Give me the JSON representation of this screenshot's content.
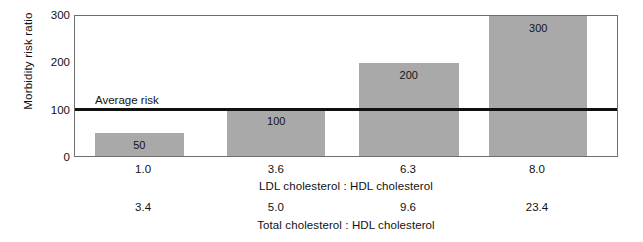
{
  "chart_data": {
    "type": "bar",
    "title": "",
    "subtitle": "",
    "ylabel": "Morbidity risk ratio",
    "ylim": [
      0,
      300
    ],
    "yticks": [
      0,
      100,
      200,
      300
    ],
    "ytick_labels": [
      "0",
      "100",
      "200",
      "300"
    ],
    "grid": false,
    "legend": null,
    "xlabel": "LDL cholesterol : HDL cholesterol",
    "xlabel_secondary": "Total cholesterol : HDL cholesterol",
    "categories": [
      "1.0",
      "3.6",
      "6.3",
      "8.0"
    ],
    "categories_secondary": [
      "3.4",
      "5.0",
      "9.6",
      "23.4"
    ],
    "values": [
      50,
      100,
      200,
      300
    ],
    "value_labels": [
      "50",
      "100",
      "200",
      "300"
    ],
    "bar_color": "#a9a9a9",
    "annotations": [
      {
        "name": "average-risk-line",
        "label": "Average risk",
        "y_value": 100,
        "color": "#111111"
      }
    ],
    "axis_color": "#6e6e6e"
  },
  "bars": [
    {
      "label": "1.0",
      "label2": "3.4",
      "value": 50,
      "value_text": "50",
      "left_pct": 3.68,
      "width_pct": 16.36
    },
    {
      "label": "3.6",
      "label2": "5.0",
      "value": 100,
      "value_text": "100",
      "left_pct": 28.13,
      "width_pct": 18.01
    },
    {
      "label": "6.3",
      "label2": "9.6",
      "value": 200,
      "value_text": "200",
      "left_pct": 52.39,
      "width_pct": 18.38
    },
    {
      "label": "8.0",
      "label2": "23.4",
      "value": 300,
      "value_text": "300",
      "left_pct": 76.47,
      "width_pct": 18.01
    }
  ],
  "tick_positions_pct": [
    12.7,
    37.1,
    61.4,
    85.1
  ]
}
